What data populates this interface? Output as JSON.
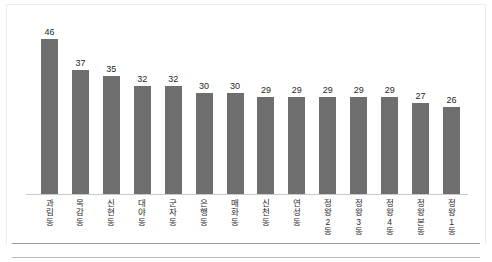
{
  "chart_data": {
    "type": "bar",
    "title": "",
    "subtitle": "",
    "xlabel": "",
    "ylabel": "",
    "ylim": [
      0,
      50
    ],
    "grid": false,
    "legend": null,
    "bar_color": "#6e6e6e",
    "axis_color": "#c9c9c9",
    "value_label_color": "#1f1f1f",
    "categories": [
      "과림동",
      "목감동",
      "신현동",
      "대야동",
      "군자동",
      "은행동",
      "매화동",
      "신천동",
      "연성동",
      "정왕2동",
      "정왕3동",
      "정왕4동",
      "정왕본동",
      "정왕1동"
    ],
    "values": [
      46,
      37,
      35,
      32,
      32,
      30,
      30,
      29,
      29,
      29,
      29,
      29,
      27,
      26
    ],
    "value_labels": [
      "46",
      "37",
      "35",
      "32",
      "32",
      "30",
      "30",
      "29",
      "29",
      "29",
      "29",
      "29",
      "27",
      "26"
    ]
  }
}
